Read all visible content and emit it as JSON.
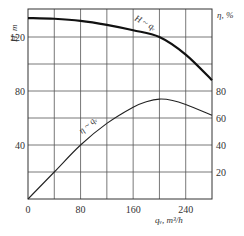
{
  "chart_data": {
    "type": "line",
    "title": "",
    "xlabel": "q_V, m³/h",
    "ylabel_left": "H, m",
    "ylabel_right": "η, %",
    "xlim": [
      0,
      280
    ],
    "ylim_left": [
      0,
      140
    ],
    "ylim_right": [
      0,
      100
    ],
    "grid": true,
    "x_ticks": [
      0,
      80,
      160,
      240
    ],
    "y_left_ticks": [
      40,
      80,
      120
    ],
    "y_right_ticks": [
      20,
      40,
      60,
      80
    ],
    "series": [
      {
        "name": "H ~ q_V",
        "axis": "left",
        "x": [
          0,
          40,
          80,
          120,
          160,
          200,
          240,
          280
        ],
        "values": [
          134,
          133.5,
          132,
          129,
          125,
          120,
          107,
          88
        ]
      },
      {
        "name": "η ~ q_V",
        "axis": "right",
        "x": [
          0,
          40,
          80,
          120,
          160,
          180,
          200,
          220,
          240,
          280
        ],
        "values": [
          0,
          20,
          40,
          56,
          68,
          72,
          74,
          73,
          70,
          62
        ]
      }
    ],
    "annotations": [
      "H ~ q_V",
      "η ~ q_V"
    ]
  },
  "labels": {
    "y_left": "H, m",
    "y_right": "η, %",
    "x": "qᵥ, m³/h",
    "curve_h": "H ~ qᵥ",
    "curve_eta": "η ~ qᵥ"
  },
  "ticks": {
    "x": [
      "0",
      "80",
      "160",
      "240"
    ],
    "y_left": [
      "120",
      "80",
      "40"
    ],
    "y_right": [
      "80",
      "60",
      "40",
      "20"
    ]
  }
}
